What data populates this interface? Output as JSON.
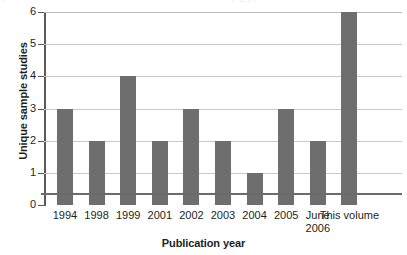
{
  "chart_data": {
    "type": "bar",
    "title": "",
    "xlabel": "Publication year",
    "ylabel": "Unique sample studies",
    "categories": [
      "1994",
      "1998",
      "1999",
      "2001",
      "2002",
      "2003",
      "2004",
      "2005",
      "June\n2006",
      "This volume"
    ],
    "values": [
      3,
      2,
      4,
      2,
      3,
      2,
      1,
      3,
      2,
      6
    ],
    "ylim": [
      0,
      6
    ],
    "yticks": [
      "0",
      "1",
      "2",
      "3",
      "4",
      "5",
      "6"
    ],
    "grid": "horizontal",
    "legend": "none",
    "bar_color": "#6e6e6e",
    "gridline_color": "#c9c7c8",
    "axis_color": "#5d595a",
    "text_color": "#231f20"
  },
  "artifacts": {
    "top_remnant_left": "y",
    "top_remnant_right": "p g g p"
  }
}
